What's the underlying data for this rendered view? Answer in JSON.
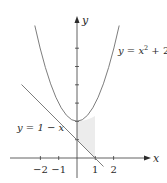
{
  "figure": {
    "axes": {
      "x_label": "x",
      "y_label": "y",
      "x_ticks": [
        {
          "value": -2,
          "label": "−2"
        },
        {
          "value": -1,
          "label": "−1"
        },
        {
          "value": 1,
          "label": "1"
        },
        {
          "value": 2,
          "label": "2"
        }
      ],
      "y_ticks": [
        1,
        2,
        3,
        4,
        5,
        6
      ]
    },
    "curves": [
      {
        "name": "parabola",
        "label": "y = x² + 2",
        "label_main": "y = x",
        "label_sup": "2",
        "label_tail": " + 2"
      },
      {
        "name": "line",
        "label": "y = 1 − x"
      }
    ],
    "shaded_region": {
      "from_x": 0,
      "to_x": 1,
      "between": [
        "y = 1 - x",
        "y = x^2 + 2"
      ]
    },
    "colors": {
      "curve": "#6e6e6e",
      "axis": "#3a3a3a",
      "shade": "#ececec"
    }
  }
}
